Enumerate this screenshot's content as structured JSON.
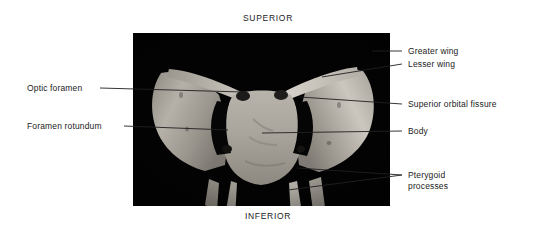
{
  "figure": {
    "view": "anterior view",
    "background_color": "#ffffff",
    "text_color": "#1b1b1b",
    "plate_background": "#030303",
    "bone_color": "#b9b5ac"
  },
  "orientation": {
    "superior": "SUPERIOR",
    "inferior": "INFERIOR"
  },
  "labels": {
    "greater_wing": "Greater wing",
    "lesser_wing": "Lesser wing",
    "superior_orbital_fissure": "Superior orbital fissure",
    "body": "Body",
    "pterygoid_processes_line1": "Pterygoid",
    "pterygoid_processes_line2": "processes",
    "optic_foramen": "Optic foramen",
    "foramen_rotundum": "Foramen rotundum"
  }
}
